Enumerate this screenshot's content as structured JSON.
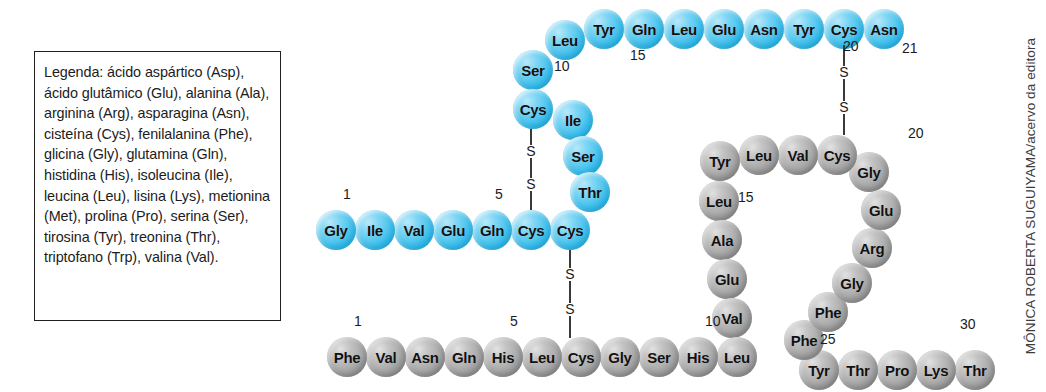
{
  "figure": {
    "credit": "MÔNICA ROBERTA SUGUIYAMA/acervo da editora"
  },
  "legend": {
    "text": "Legenda: ácido aspártico (Asp), ácido glutâmico (Glu), alanina (Ala), arginina (Arg), asparagina (Asn), cisteína (Cys), fenilalanina (Phe), glicina (Gly), glutamina (Gln), histidina (His), isoleucina (Ile), leucina (Leu), lisina (Lys), metionina (Met), prolina (Pro), serina (Ser), tirosina (Tyr), treonina (Thr), triptofano (Trp), valina (Val)."
  },
  "chain_a": {
    "name": "A",
    "color": "#3fc0ec",
    "residues": [
      {
        "n": 1,
        "label": "Gly",
        "x": 316,
        "y": 210
      },
      {
        "n": 2,
        "label": "Ile",
        "x": 355,
        "y": 210
      },
      {
        "n": 3,
        "label": "Val",
        "x": 394,
        "y": 210
      },
      {
        "n": 4,
        "label": "Glu",
        "x": 433,
        "y": 210
      },
      {
        "n": 5,
        "label": "Gln",
        "x": 472,
        "y": 210
      },
      {
        "n": 6,
        "label": "Cys",
        "x": 511,
        "y": 210
      },
      {
        "n": 7,
        "label": "Cys",
        "x": 550,
        "y": 210
      },
      {
        "n": 8,
        "label": "Thr",
        "x": 570,
        "y": 172
      },
      {
        "n": 9,
        "label": "Ser",
        "x": 563,
        "y": 136
      },
      {
        "n": 10,
        "label": "Ile",
        "x": 553,
        "y": 100
      },
      {
        "n": 11,
        "label": "Cys",
        "x": 513,
        "y": 89
      },
      {
        "n": 12,
        "label": "Ser",
        "x": 513,
        "y": 50
      },
      {
        "n": 13,
        "label": "Leu",
        "x": 545,
        "y": 20
      },
      {
        "n": 14,
        "label": "Tyr",
        "x": 584,
        "y": 9
      },
      {
        "n": 15,
        "label": "Gln",
        "x": 624,
        "y": 9
      },
      {
        "n": 16,
        "label": "Leu",
        "x": 664,
        "y": 9
      },
      {
        "n": 17,
        "label": "Glu",
        "x": 704,
        "y": 9
      },
      {
        "n": 18,
        "label": "Asn",
        "x": 744,
        "y": 9
      },
      {
        "n": 19,
        "label": "Tyr",
        "x": 784,
        "y": 9
      },
      {
        "n": 20,
        "label": "Cys",
        "x": 824,
        "y": 9
      },
      {
        "n": 21,
        "label": "Asn",
        "x": 864,
        "y": 9
      }
    ],
    "numbers": [
      {
        "text": "1",
        "x": 343,
        "y": 186
      },
      {
        "text": "5",
        "x": 495,
        "y": 186
      },
      {
        "text": "10",
        "x": 554,
        "y": 58
      },
      {
        "text": "15",
        "x": 630,
        "y": 47
      },
      {
        "text": "20",
        "x": 843,
        "y": 38
      },
      {
        "text": "21",
        "x": 902,
        "y": 40
      }
    ]
  },
  "chain_b": {
    "name": "B",
    "color": "#a6a6a6",
    "residues": [
      {
        "n": 1,
        "label": "Phe",
        "x": 327,
        "y": 337
      },
      {
        "n": 2,
        "label": "Val",
        "x": 366,
        "y": 337
      },
      {
        "n": 3,
        "label": "Asn",
        "x": 405,
        "y": 337
      },
      {
        "n": 4,
        "label": "Gln",
        "x": 444,
        "y": 337
      },
      {
        "n": 5,
        "label": "His",
        "x": 483,
        "y": 337
      },
      {
        "n": 6,
        "label": "Leu",
        "x": 522,
        "y": 337
      },
      {
        "n": 7,
        "label": "Cys",
        "x": 561,
        "y": 337
      },
      {
        "n": 8,
        "label": "Gly",
        "x": 600,
        "y": 337
      },
      {
        "n": 9,
        "label": "Ser",
        "x": 639,
        "y": 337
      },
      {
        "n": 10,
        "label": "His",
        "x": 678,
        "y": 337
      },
      {
        "n": 11,
        "label": "Leu",
        "x": 717,
        "y": 337
      },
      {
        "n": 12,
        "label": "Val",
        "x": 712,
        "y": 298
      },
      {
        "n": 13,
        "label": "Glu",
        "x": 707,
        "y": 259
      },
      {
        "n": 14,
        "label": "Ala",
        "x": 702,
        "y": 220
      },
      {
        "n": 15,
        "label": "Leu",
        "x": 699,
        "y": 181
      },
      {
        "n": 16,
        "label": "Tyr",
        "x": 700,
        "y": 141
      },
      {
        "n": 17,
        "label": "Leu",
        "x": 739,
        "y": 135
      },
      {
        "n": 18,
        "label": "Val",
        "x": 778,
        "y": 135
      },
      {
        "n": 19,
        "label": "Cys",
        "x": 817,
        "y": 135
      },
      {
        "n": 20,
        "label": "Gly",
        "x": 849,
        "y": 152
      },
      {
        "n": 21,
        "label": "Glu",
        "x": 861,
        "y": 190
      },
      {
        "n": 22,
        "label": "Arg",
        "x": 852,
        "y": 228
      },
      {
        "n": 23,
        "label": "Gly",
        "x": 832,
        "y": 263
      },
      {
        "n": 24,
        "label": "Phe",
        "x": 808,
        "y": 292
      },
      {
        "n": 25,
        "label": "Phe",
        "x": 784,
        "y": 320
      },
      {
        "n": 26,
        "label": "Tyr",
        "x": 799,
        "y": 350
      },
      {
        "n": 27,
        "label": "Thr",
        "x": 838,
        "y": 350
      },
      {
        "n": 28,
        "label": "Pro",
        "x": 877,
        "y": 350
      },
      {
        "n": 29,
        "label": "Lys",
        "x": 916,
        "y": 350
      },
      {
        "n": 30,
        "label": "Thr",
        "x": 955,
        "y": 350
      }
    ],
    "numbers": [
      {
        "text": "1",
        "x": 354,
        "y": 313
      },
      {
        "text": "5",
        "x": 510,
        "y": 313
      },
      {
        "text": "10",
        "x": 705,
        "y": 313
      },
      {
        "text": "15",
        "x": 738,
        "y": 189
      },
      {
        "text": "20",
        "x": 908,
        "y": 125
      },
      {
        "text": "25",
        "x": 820,
        "y": 331
      },
      {
        "text": "30",
        "x": 960,
        "y": 316
      }
    ]
  },
  "disulfide_bridges": [
    {
      "id": "a6-a11",
      "label": "S-S",
      "x": 523,
      "y": 126,
      "height": 88
    },
    {
      "id": "a7-b7",
      "label": "S-S",
      "x": 562,
      "y": 246,
      "height": 96
    },
    {
      "id": "a20-b19",
      "label": "S-S",
      "x": 836,
      "y": 45,
      "height": 94
    }
  ]
}
